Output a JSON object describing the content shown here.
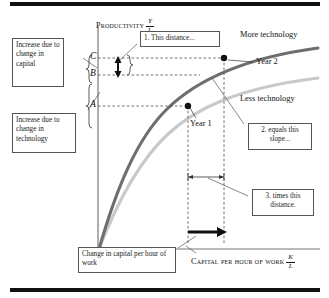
{
  "figure": {
    "type": "diagram",
    "top_rule": "",
    "bottom_rule": ""
  },
  "axes": {
    "y_title": "Productivity",
    "y_ratio_num": "Y",
    "y_ratio_den": "L",
    "x_title": "Capital per hour of work",
    "x_ratio_num": "K",
    "x_ratio_den": "L",
    "y_marks": [
      "C",
      "B",
      "A"
    ],
    "axis_color": "#666666"
  },
  "curves": [
    {
      "name": "More technology",
      "label": "More technology",
      "color": "#6e6e6e"
    },
    {
      "name": "Less technology",
      "label": "Less technology",
      "color": "#c9c9c9"
    }
  ],
  "points": [
    {
      "name": "Year 1",
      "label": "Year 1",
      "y_mark": "A"
    },
    {
      "name": "Year 2",
      "label": "Year 2",
      "y_mark": "C"
    }
  ],
  "callouts": [
    {
      "id": "increase-capital",
      "text": "Increase due to change in capital"
    },
    {
      "id": "increase-technology",
      "text": "Increase due to change in technology"
    },
    {
      "id": "step-1",
      "text": "1. This distance..."
    },
    {
      "id": "step-2",
      "text": "2. equals this slope..."
    },
    {
      "id": "step-3",
      "text": "3. times this distance."
    },
    {
      "id": "change-capital",
      "text": "Change in capital per hour of work"
    }
  ],
  "colors": {
    "more_technology": "#6e6e6e",
    "less_technology": "#c9c9c9",
    "guide_line": "#4d4d4d",
    "rule": "#111111",
    "box_border": "#555555"
  }
}
